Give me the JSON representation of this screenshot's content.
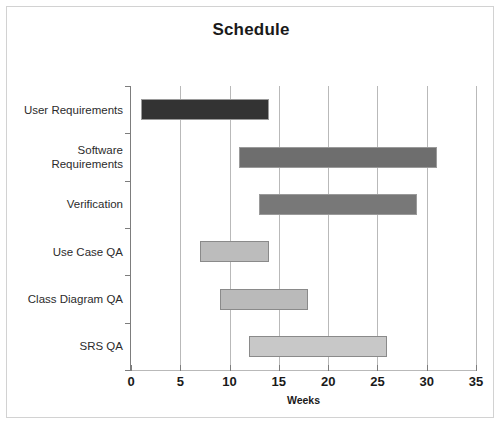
{
  "frame": {
    "border_color": "#d2d2d2",
    "background": "#ffffff"
  },
  "chart_data": {
    "type": "bar",
    "subtype": "gantt",
    "title": "Schedule",
    "xlabel": "Weeks",
    "ylabel": "",
    "xlim": [
      0,
      35
    ],
    "xticks": [
      0,
      5,
      10,
      15,
      20,
      25,
      30,
      35
    ],
    "xticklabels": [
      "0",
      "5",
      "10",
      "15",
      "20",
      "25",
      "30",
      "35"
    ],
    "grid": "vertical",
    "legend": "none",
    "categories": [
      "User Requirements",
      "Software\nRequirements",
      "Verification",
      "Use Case QA",
      "Class Diagram QA",
      "SRS QA"
    ],
    "tasks": [
      {
        "name": "User Requirements",
        "label_lines": [
          "User Requirements"
        ],
        "start": 1,
        "end": 14,
        "duration": 13,
        "color": "#333333",
        "edge_color": "#9a9a9a"
      },
      {
        "name": "Software Requirements",
        "label_lines": [
          "Software",
          "Requirements"
        ],
        "start": 11,
        "end": 31,
        "duration": 20,
        "color": "#6e6e6e",
        "edge_color": "#9a9a9a"
      },
      {
        "name": "Verification",
        "label_lines": [
          "Verification"
        ],
        "start": 13,
        "end": 29,
        "duration": 16,
        "color": "#787878",
        "edge_color": "#9a9a9a"
      },
      {
        "name": "Use Case QA",
        "label_lines": [
          "Use Case QA"
        ],
        "start": 7,
        "end": 14,
        "duration": 7,
        "color": "#bcbcbc",
        "edge_color": "#8a8a8a"
      },
      {
        "name": "Class Diagram QA",
        "label_lines": [
          "Class Diagram QA"
        ],
        "start": 9,
        "end": 18,
        "duration": 9,
        "color": "#bababa",
        "edge_color": "#8a8a8a"
      },
      {
        "name": "SRS QA",
        "label_lines": [
          "SRS QA"
        ],
        "start": 12,
        "end": 26,
        "duration": 14,
        "color": "#c8c8c8",
        "edge_color": "#8a8a8a"
      }
    ]
  }
}
